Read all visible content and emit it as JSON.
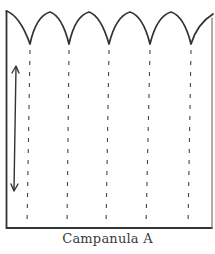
{
  "caption": "Campanula A",
  "diagram": {
    "type": "sewing-pattern-piece",
    "stroke_color": "#333333",
    "frame": {
      "left": 6,
      "right": 212,
      "top_left_y": 12,
      "bottom": 228
    },
    "scallop_valleys_x": [
      30,
      69,
      109,
      150,
      191
    ],
    "scallop_valley_y": 44,
    "scallop_peak_y": 12,
    "dashed_lines_x": [
      30,
      69,
      109,
      150,
      191
    ],
    "grainline_arrow": {
      "x": 15,
      "y1": 66,
      "y2": 190,
      "double_headed": true
    }
  }
}
